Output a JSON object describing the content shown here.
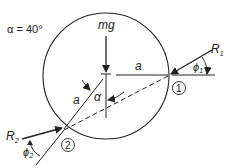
{
  "diagram": {
    "given": "α = 40°",
    "weight_label": "mg",
    "radius_label_horizontal": "a",
    "radius_label_slanted": "a",
    "angle_label": "α",
    "force1_label": "R",
    "force1_sub": "1",
    "force2_label": "R",
    "force2_sub": "2",
    "angle1_label": "ϕ",
    "angle1_sub": "1",
    "angle2_label": "ϕ",
    "angle2_sub": "2",
    "contact1_label": "1",
    "contact2_label": "2",
    "colors": {
      "stroke": "#222222",
      "background": "#ffffff"
    }
  }
}
